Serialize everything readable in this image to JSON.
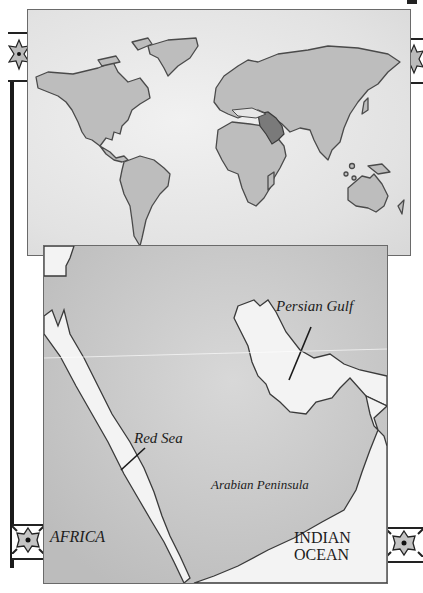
{
  "world_map": {
    "highlight_region": "Arabian Peninsula",
    "colors": {
      "ocean": "#e6e6e6",
      "land": "#bdbdbd",
      "coast": "#4a4a4a",
      "highlight": "#7a7a7a"
    }
  },
  "inset_map": {
    "labels": {
      "persian_gulf": "Persian Gulf",
      "red_sea": "Red Sea",
      "arabian_peninsula": "Arabian Peninsula",
      "africa": "AFRICA",
      "indian_ocean_line1": "INDIAN",
      "indian_ocean_line2": "OCEAN"
    },
    "colors": {
      "land": "#cfcfcf",
      "water": "#f3f3f3",
      "coast": "#3a3a3a",
      "text": "#1c1c1c"
    }
  },
  "decorations": {
    "tile_icon": "eight-point-star-tile"
  }
}
